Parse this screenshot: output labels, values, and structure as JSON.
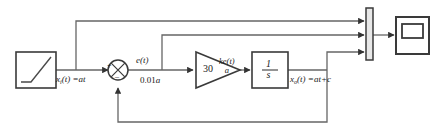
{
  "figure": {
    "type": "control-system-block-diagram",
    "title_fragment": "",
    "stroke_color": "#555555",
    "block_border_color": "#3a3a3a",
    "text_color": "#1a1a1a",
    "background": "#ffffff"
  },
  "blocks": {
    "ramp_source": {
      "name": "ramp-source-block",
      "label": "",
      "icon": "ramp-icon"
    },
    "sum_junction": {
      "name": "sum-junction",
      "plus_sign": "+",
      "minus_sign": "–",
      "icon": "cross-circle-icon"
    },
    "gain": {
      "name": "gain-block",
      "value": "30",
      "icon": "triangle-gain-icon"
    },
    "integrator": {
      "name": "integrator-block",
      "numerator": "1",
      "denominator": "s"
    },
    "mux": {
      "name": "mux-bar",
      "inputs": 3
    },
    "scope": {
      "name": "scope-block",
      "icon": "scope-icon"
    }
  },
  "signals": {
    "input": {
      "name": "input-signal-label",
      "var": "x",
      "subscript": "i",
      "expr": "(t) =at"
    },
    "error": {
      "name": "error-signal-label",
      "text": "e(t)"
    },
    "error_value": {
      "name": "error-value-label",
      "prefix": "0.01",
      "var": "a"
    },
    "gain_output_num": {
      "name": "gain-output-numerator",
      "text": "ke(t)"
    },
    "gain_output_den": {
      "name": "gain-output-denominator",
      "text": "a"
    },
    "output": {
      "name": "output-signal-label",
      "var": "x",
      "subscript": "o",
      "expr": "(t) =at+c"
    }
  }
}
